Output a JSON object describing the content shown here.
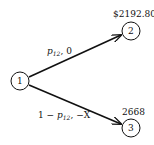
{
  "nodes": [
    {
      "id": "1",
      "label": "1",
      "cx": 20,
      "cy": 81
    },
    {
      "id": "2",
      "label": "2",
      "cx": 131,
      "cy": 31
    },
    {
      "id": "3",
      "label": "3",
      "cx": 131,
      "cy": 128
    }
  ],
  "node_values": {
    "n2": "$2192.80",
    "n3": "2668"
  },
  "edges": {
    "e12": {
      "prob_var": "p",
      "prob_sub": "12",
      "sep": ",",
      "payoff": "0"
    },
    "e13": {
      "prefix": "1 − ",
      "prob_var": "p",
      "prob_sub": "12",
      "sep": ",",
      "payoff": "−X"
    }
  },
  "colors": {
    "stroke": "#111111",
    "background": "#ffffff"
  }
}
